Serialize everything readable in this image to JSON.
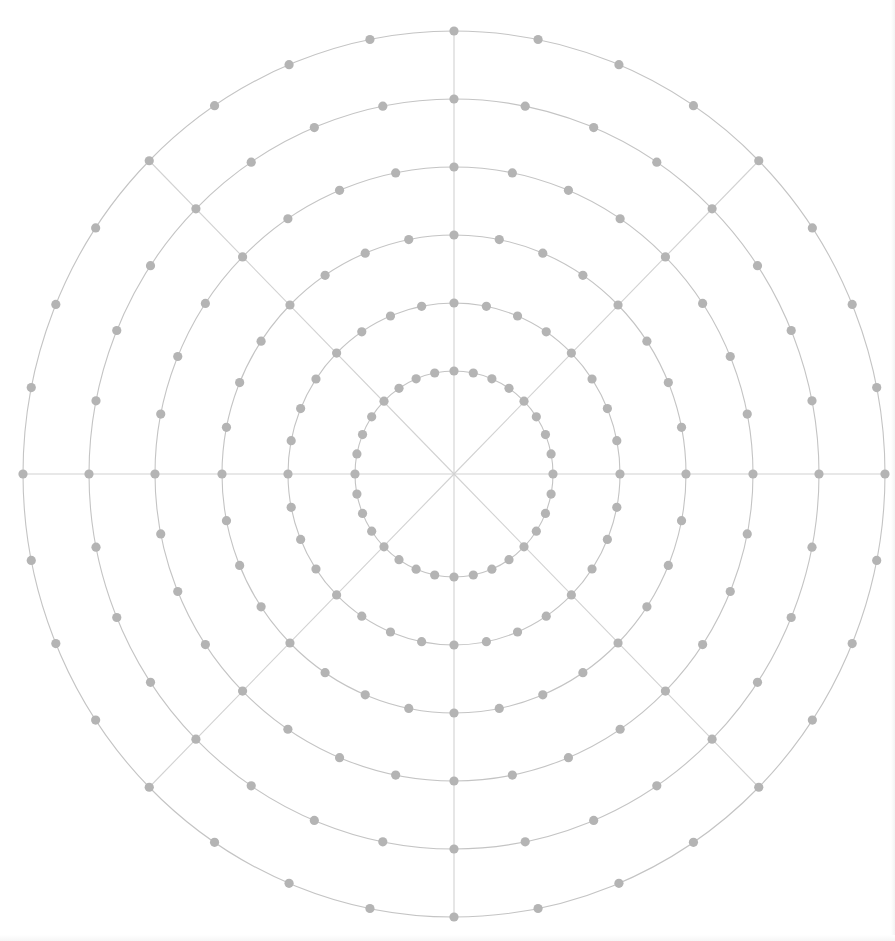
{
  "diagram": {
    "type": "polar-grid",
    "center": {
      "x": 454,
      "y": 474
    },
    "rings": [
      {
        "index": 1,
        "rx": 99,
        "ry": 103,
        "dot_count": 32
      },
      {
        "index": 2,
        "rx": 166,
        "ry": 171,
        "dot_count": 32
      },
      {
        "index": 3,
        "rx": 232,
        "ry": 239,
        "dot_count": 32
      },
      {
        "index": 4,
        "rx": 299,
        "ry": 307,
        "dot_count": 32
      },
      {
        "index": 5,
        "rx": 365,
        "ry": 375,
        "dot_count": 32
      },
      {
        "index": 6,
        "rx": 431,
        "ry": 443,
        "dot_count": 32
      }
    ],
    "spokes": {
      "count": 8,
      "angles_deg": [
        0,
        45,
        90,
        135,
        180,
        225,
        270,
        315
      ]
    },
    "colors": {
      "background": "#ffffff",
      "ring_stroke": "#c4c4c4",
      "spoke_stroke": "#d2d2d2",
      "dot_fill": "#b4b4b4"
    },
    "dot_radius": 4.6,
    "ring_stroke_width": 1.1,
    "spoke_stroke_width": 1.1
  }
}
